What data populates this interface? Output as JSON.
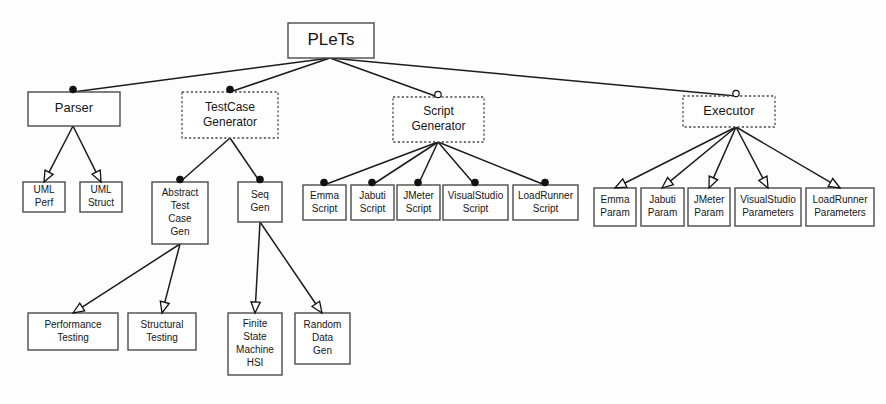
{
  "diagram": {
    "title": "PLeTs",
    "type": "feature-model",
    "notation": {
      "filled_circle": "mandatory",
      "hollow_circle": "optional",
      "hollow_arrow": "alternative",
      "solid_box": "concrete feature",
      "dashed_box": "abstract feature"
    },
    "colors": {
      "box_stroke": "#4a4a4a",
      "edge_stroke": "#1c1c1c",
      "text": "#161616",
      "background": "#ffffff"
    },
    "nodes": [
      {
        "id": "plets",
        "label": "PLeTs",
        "lines": [
          "PLeTs"
        ],
        "x": 288,
        "y": 23,
        "w": 86,
        "h": 35,
        "style": "solid",
        "font": 17
      },
      {
        "id": "parser",
        "label": "Parser",
        "lines": [
          "Parser"
        ],
        "x": 28,
        "y": 92,
        "w": 92,
        "h": 34,
        "style": "solid",
        "font": 13
      },
      {
        "id": "testcase_generator",
        "label": "TestCase Generator",
        "lines": [
          "TestCase",
          "Generator"
        ],
        "x": 182,
        "y": 92,
        "w": 96,
        "h": 46,
        "style": "dashed",
        "font": 12
      },
      {
        "id": "script_generator",
        "label": "Script Generator",
        "lines": [
          "Script",
          "Generator"
        ],
        "x": 393,
        "y": 97,
        "w": 91,
        "h": 45,
        "style": "dashed",
        "font": 12
      },
      {
        "id": "executor",
        "label": "Executor",
        "lines": [
          "Executor"
        ],
        "x": 683,
        "y": 96,
        "w": 92,
        "h": 31,
        "style": "dashed",
        "font": 13
      },
      {
        "id": "uml_perf",
        "label": "UML Perf",
        "lines": [
          "UML",
          "Perf"
        ],
        "x": 23,
        "y": 182,
        "w": 42,
        "h": 30,
        "style": "solid",
        "font": 10
      },
      {
        "id": "uml_struct",
        "label": "UML Struct",
        "lines": [
          "UML",
          "Struct"
        ],
        "x": 80,
        "y": 182,
        "w": 42,
        "h": 30,
        "style": "solid",
        "font": 10
      },
      {
        "id": "abstract_test_case_gen",
        "label": "Abstract Test Case Gen",
        "lines": [
          "Abstract",
          "Test",
          "Case",
          "Gen"
        ],
        "x": 152,
        "y": 182,
        "w": 56,
        "h": 62,
        "style": "solid",
        "font": 10
      },
      {
        "id": "seq_gen",
        "label": "Seq Gen",
        "lines": [
          "Seq",
          "Gen"
        ],
        "x": 238,
        "y": 182,
        "w": 44,
        "h": 40,
        "style": "solid",
        "font": 10
      },
      {
        "id": "emma_script",
        "label": "Emma Script",
        "lines": [
          "Emma",
          "Script"
        ],
        "x": 303,
        "y": 185,
        "w": 43,
        "h": 35,
        "style": "solid",
        "font": 10
      },
      {
        "id": "jabuti_script",
        "label": "Jabuti Script",
        "lines": [
          "Jabuti",
          "Script"
        ],
        "x": 351,
        "y": 185,
        "w": 43,
        "h": 35,
        "style": "solid",
        "font": 10
      },
      {
        "id": "jmeter_script",
        "label": "JMeter Script",
        "lines": [
          "JMeter",
          "Script"
        ],
        "x": 397,
        "y": 185,
        "w": 43,
        "h": 35,
        "style": "solid",
        "font": 10
      },
      {
        "id": "visualstudio_script",
        "label": "VisualStudio Script",
        "lines": [
          "VisualStudio",
          "Script"
        ],
        "x": 443,
        "y": 185,
        "w": 65,
        "h": 35,
        "style": "solid",
        "font": 10
      },
      {
        "id": "loadrunner_script",
        "label": "LoadRunner Script",
        "lines": [
          "LoadRunner",
          "Script"
        ],
        "x": 513,
        "y": 185,
        "w": 65,
        "h": 35,
        "style": "solid",
        "font": 10
      },
      {
        "id": "emma_param",
        "label": "Emma Param",
        "lines": [
          "Emma",
          "Param"
        ],
        "x": 594,
        "y": 188,
        "w": 42,
        "h": 38,
        "style": "solid",
        "font": 10
      },
      {
        "id": "jabuti_param",
        "label": "Jabuti Param",
        "lines": [
          "Jabuti",
          "Param"
        ],
        "x": 641,
        "y": 188,
        "w": 43,
        "h": 38,
        "style": "solid",
        "font": 10
      },
      {
        "id": "jmeter_param",
        "label": "JMeter Param",
        "lines": [
          "JMeter",
          "Param"
        ],
        "x": 688,
        "y": 188,
        "w": 42,
        "h": 38,
        "style": "solid",
        "font": 10
      },
      {
        "id": "visualstudio_parameters",
        "label": "VisualStudio Parameters",
        "lines": [
          "VisualStudio",
          "Parameters"
        ],
        "x": 735,
        "y": 188,
        "w": 66,
        "h": 38,
        "style": "solid",
        "font": 10
      },
      {
        "id": "loadrunner_parameters",
        "label": "LoadRunner Parameters",
        "lines": [
          "LoadRunner",
          "Parameters"
        ],
        "x": 806,
        "y": 188,
        "w": 68,
        "h": 38,
        "style": "solid",
        "font": 10
      },
      {
        "id": "performance_testing",
        "label": "Performance Testing",
        "lines": [
          "Performance",
          "Testing"
        ],
        "x": 28,
        "y": 313,
        "w": 90,
        "h": 37,
        "style": "solid",
        "font": 10
      },
      {
        "id": "structural_testing",
        "label": "Structural Testing",
        "lines": [
          "Structural",
          "Testing"
        ],
        "x": 128,
        "y": 313,
        "w": 68,
        "h": 37,
        "style": "solid",
        "font": 10
      },
      {
        "id": "finite_state_machine_hsi",
        "label": "Finite State Machine HSI",
        "lines": [
          "Finite",
          "State",
          "Machine",
          "HSI"
        ],
        "x": 228,
        "y": 313,
        "w": 54,
        "h": 62,
        "style": "solid",
        "font": 10
      },
      {
        "id": "random_data_gen",
        "label": "Random Data Gen",
        "lines": [
          "Random",
          "Data",
          "Gen"
        ],
        "x": 295,
        "y": 313,
        "w": 55,
        "h": 51,
        "style": "solid",
        "font": 10
      }
    ],
    "edges": [
      {
        "from": "plets",
        "to": "parser",
        "x1": 330,
        "y1": 58,
        "x2": 73,
        "y2": 92,
        "marker": "filled-circle"
      },
      {
        "from": "plets",
        "to": "testcase_generator",
        "x1": 330,
        "y1": 58,
        "x2": 230,
        "y2": 92,
        "marker": "filled-circle"
      },
      {
        "from": "plets",
        "to": "script_generator",
        "x1": 330,
        "y1": 58,
        "x2": 438,
        "y2": 97,
        "marker": "hollow-circle"
      },
      {
        "from": "plets",
        "to": "executor",
        "x1": 330,
        "y1": 58,
        "x2": 736,
        "y2": 96,
        "marker": "hollow-circle"
      },
      {
        "from": "parser",
        "to": "uml_perf",
        "x1": 73,
        "y1": 126,
        "x2": 44,
        "y2": 182,
        "marker": "hollow-arrow"
      },
      {
        "from": "parser",
        "to": "uml_struct",
        "x1": 73,
        "y1": 126,
        "x2": 101,
        "y2": 182,
        "marker": "hollow-arrow"
      },
      {
        "from": "testcase_generator",
        "to": "abstract_test_case_gen",
        "x1": 230,
        "y1": 138,
        "x2": 180,
        "y2": 182,
        "marker": "filled-circle"
      },
      {
        "from": "testcase_generator",
        "to": "seq_gen",
        "x1": 230,
        "y1": 138,
        "x2": 260,
        "y2": 182,
        "marker": "filled-circle"
      },
      {
        "from": "abstract_test_case_gen",
        "to": "performance_testing",
        "x1": 180,
        "y1": 244,
        "x2": 73,
        "y2": 313,
        "marker": "hollow-arrow"
      },
      {
        "from": "abstract_test_case_gen",
        "to": "structural_testing",
        "x1": 180,
        "y1": 244,
        "x2": 162,
        "y2": 313,
        "marker": "hollow-arrow"
      },
      {
        "from": "seq_gen",
        "to": "finite_state_machine_hsi",
        "x1": 260,
        "y1": 222,
        "x2": 255,
        "y2": 313,
        "marker": "hollow-arrow"
      },
      {
        "from": "seq_gen",
        "to": "random_data_gen",
        "x1": 260,
        "y1": 222,
        "x2": 322,
        "y2": 313,
        "marker": "hollow-arrow"
      },
      {
        "from": "script_generator",
        "to": "emma_script",
        "x1": 438,
        "y1": 142,
        "x2": 324,
        "y2": 185,
        "marker": "filled-circle"
      },
      {
        "from": "script_generator",
        "to": "jabuti_script",
        "x1": 438,
        "y1": 142,
        "x2": 372,
        "y2": 185,
        "marker": "filled-circle"
      },
      {
        "from": "script_generator",
        "to": "jmeter_script",
        "x1": 438,
        "y1": 142,
        "x2": 418,
        "y2": 185,
        "marker": "filled-circle"
      },
      {
        "from": "script_generator",
        "to": "visualstudio_script",
        "x1": 438,
        "y1": 142,
        "x2": 475,
        "y2": 185,
        "marker": "filled-circle"
      },
      {
        "from": "script_generator",
        "to": "loadrunner_script",
        "x1": 438,
        "y1": 142,
        "x2": 545,
        "y2": 185,
        "marker": "filled-circle"
      },
      {
        "from": "executor",
        "to": "emma_param",
        "x1": 736,
        "y1": 127,
        "x2": 615,
        "y2": 188,
        "marker": "hollow-arrow"
      },
      {
        "from": "executor",
        "to": "jabuti_param",
        "x1": 736,
        "y1": 127,
        "x2": 662,
        "y2": 188,
        "marker": "hollow-arrow"
      },
      {
        "from": "executor",
        "to": "jmeter_param",
        "x1": 736,
        "y1": 127,
        "x2": 709,
        "y2": 188,
        "marker": "hollow-arrow"
      },
      {
        "from": "executor",
        "to": "visualstudio_parameters",
        "x1": 736,
        "y1": 127,
        "x2": 768,
        "y2": 188,
        "marker": "hollow-arrow"
      },
      {
        "from": "executor",
        "to": "loadrunner_parameters",
        "x1": 736,
        "y1": 127,
        "x2": 840,
        "y2": 188,
        "marker": "hollow-arrow"
      }
    ]
  }
}
